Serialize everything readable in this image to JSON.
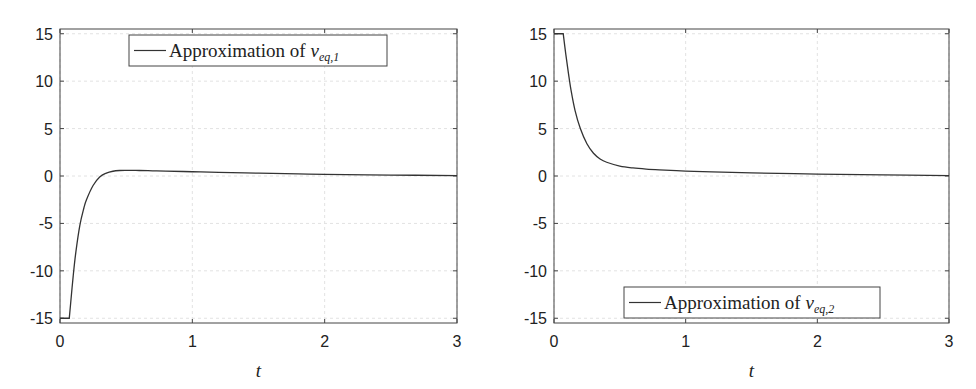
{
  "chart_data": [
    {
      "type": "line",
      "title": "",
      "xlabel": "t",
      "ylabel": "",
      "xlim": [
        0,
        3
      ],
      "ylim": [
        -15.5,
        15.5
      ],
      "grid": true,
      "legend_position": "upper center",
      "xticks": [
        "0",
        "1",
        "2",
        "3"
      ],
      "yticks": [
        "-15",
        "-10",
        "-5",
        "0",
        "5",
        "10",
        "15"
      ],
      "series": [
        {
          "name": "Approximation of ν_eq,1",
          "legend_text": "Approximation of ",
          "legend_symbol": "ν",
          "legend_subscript": "eq,1",
          "color": "#333333",
          "x": [
            0,
            0.07,
            0.08,
            0.1,
            0.12,
            0.15,
            0.18,
            0.2,
            0.25,
            0.3,
            0.35,
            0.4,
            0.45,
            0.5,
            0.55,
            0.6,
            0.7,
            0.8,
            1.0,
            1.2,
            1.5,
            1.8,
            2.0,
            2.5,
            3.0
          ],
          "y": [
            -15,
            -15,
            -13.5,
            -10.5,
            -8.0,
            -5.2,
            -3.4,
            -2.5,
            -1.0,
            -0.1,
            0.3,
            0.5,
            0.58,
            0.6,
            0.6,
            0.58,
            0.55,
            0.52,
            0.45,
            0.38,
            0.3,
            0.22,
            0.18,
            0.1,
            0.05
          ]
        }
      ]
    },
    {
      "type": "line",
      "title": "",
      "xlabel": "t",
      "ylabel": "",
      "xlim": [
        0,
        3
      ],
      "ylim": [
        -15.5,
        15.5
      ],
      "grid": true,
      "legend_position": "lower right",
      "xticks": [
        "0",
        "1",
        "2",
        "3"
      ],
      "yticks": [
        "-15",
        "-10",
        "-5",
        "0",
        "5",
        "10",
        "15"
      ],
      "series": [
        {
          "name": "Approximation of ν_eq,2",
          "legend_text": "Approximation of ",
          "legend_symbol": "ν",
          "legend_subscript": "eq,2",
          "color": "#333333",
          "x": [
            0,
            0.07,
            0.09,
            0.11,
            0.13,
            0.16,
            0.2,
            0.25,
            0.3,
            0.35,
            0.4,
            0.5,
            0.6,
            0.7,
            0.8,
            1.0,
            1.2,
            1.5,
            2.0,
            2.5,
            3.0
          ],
          "y": [
            15,
            15,
            12.8,
            10.8,
            9.0,
            6.9,
            5.0,
            3.4,
            2.4,
            1.8,
            1.45,
            1.05,
            0.85,
            0.73,
            0.65,
            0.52,
            0.43,
            0.33,
            0.2,
            0.11,
            0.05
          ]
        }
      ]
    }
  ]
}
